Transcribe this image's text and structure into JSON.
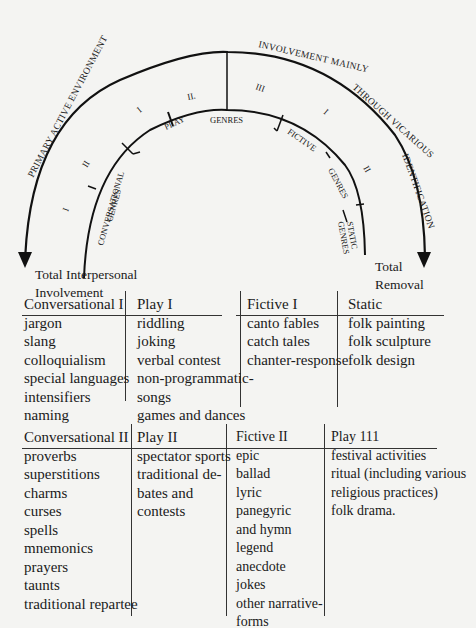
{
  "diagram": {
    "outer_arc_left_label": "PRIMARY ACTIVE ENVIRONMENT",
    "outer_arc_right_label": "INVOLVEMENT MAINLY THROUGH VICARIOUS IDENTIFICATION",
    "inner_labels": {
      "conversational": "CONVERSATIONAL",
      "conversational_genres": "GENRES",
      "play": "PLAY",
      "genres_center": "GENRES",
      "fictive": "FICTIVE",
      "fictive_genres": "GENRES",
      "static": "STATIC",
      "static_genres": "GENRES"
    },
    "roman_numerals": {
      "conv_i": "I",
      "conv_ii": "II",
      "play_i": "I",
      "play_ii": "II.",
      "play_iii": "III",
      "fictive_i": "I",
      "fictive_ii": "II"
    },
    "left_endpoint": [
      "Total Interpersonal",
      "Involvement"
    ],
    "right_endpoint": [
      "Total",
      "Removal"
    ]
  },
  "table_top": {
    "columns": [
      {
        "header": "Conversational I",
        "items": [
          "jargon",
          "slang",
          "colloquialism",
          "special languages",
          "intensifiers",
          "naming"
        ]
      },
      {
        "header": "Play I",
        "items": [
          "riddling",
          "joking",
          "verbal contest",
          "non-programmatic-",
          "songs",
          "games and dances"
        ]
      },
      {
        "header": "Fictive I",
        "items": [
          "canto fables",
          "catch tales",
          "chanter-response"
        ]
      },
      {
        "header": "Static",
        "items": [
          "folk painting",
          "folk sculpture",
          "folk design"
        ]
      }
    ]
  },
  "table_bottom": {
    "columns": [
      {
        "header": "Conversational II",
        "items": [
          "proverbs",
          "superstitions",
          "charms",
          "curses",
          "spells",
          "mnemonics",
          "prayers",
          "taunts",
          "traditional repartee"
        ]
      },
      {
        "header": "Play II",
        "items": [
          "spectator sports",
          "traditional de-",
          "bates and",
          "contests"
        ]
      },
      {
        "header": "Fictive II",
        "items": [
          "epic",
          "ballad",
          "lyric",
          "panegyric",
          "and hymn",
          "legend",
          "anecdote",
          "jokes",
          "other narrative-",
          "forms"
        ]
      },
      {
        "header": "Play 111",
        "items": [
          "festival activities",
          "ritual (including various",
          "religious practices)",
          "folk drama."
        ]
      }
    ]
  }
}
